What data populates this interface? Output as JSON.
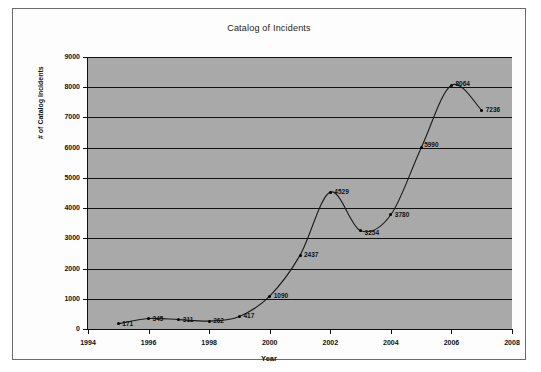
{
  "chart_data": {
    "type": "line",
    "title": "Catalog of Incidents",
    "xlabel": "Year",
    "ylabel": "# of Catalog Incidents",
    "xlim": [
      1994,
      2008
    ],
    "ylim": [
      0,
      9000
    ],
    "grid": true,
    "legend": "none",
    "x_ticks": [
      "1994",
      "1996",
      "1998",
      "2000",
      "2002",
      "2004",
      "2006",
      "2008"
    ],
    "x_tick_values": [
      1994,
      1996,
      1998,
      2000,
      2002,
      2004,
      2006,
      2008
    ],
    "y_ticks": [
      "0",
      "1000",
      "2000",
      "3000",
      "4000",
      "5000",
      "6000",
      "7000",
      "8000",
      "9000"
    ],
    "y_tick_values": [
      0,
      1000,
      2000,
      3000,
      4000,
      5000,
      6000,
      7000,
      8000,
      9000
    ],
    "x": [
      1995,
      1996,
      1997,
      1998,
      1999,
      2000,
      2001,
      2002,
      2003,
      2004,
      2005,
      2006,
      2007
    ],
    "values": [
      171,
      345,
      311,
      262,
      417,
      1090,
      2437,
      4529,
      3254,
      3780,
      5990,
      8064,
      7236
    ],
    "point_labels": [
      "171",
      "345",
      "311",
      "262",
      "417",
      "1090",
      "2437",
      "4529",
      "3254",
      "3780",
      "5990",
      "8064",
      "7236"
    ],
    "marker_color": "#000000",
    "line_color": "#1a1a1a",
    "plot_background": "#a9a9a9",
    "chart_background": "#fdfdfd"
  }
}
